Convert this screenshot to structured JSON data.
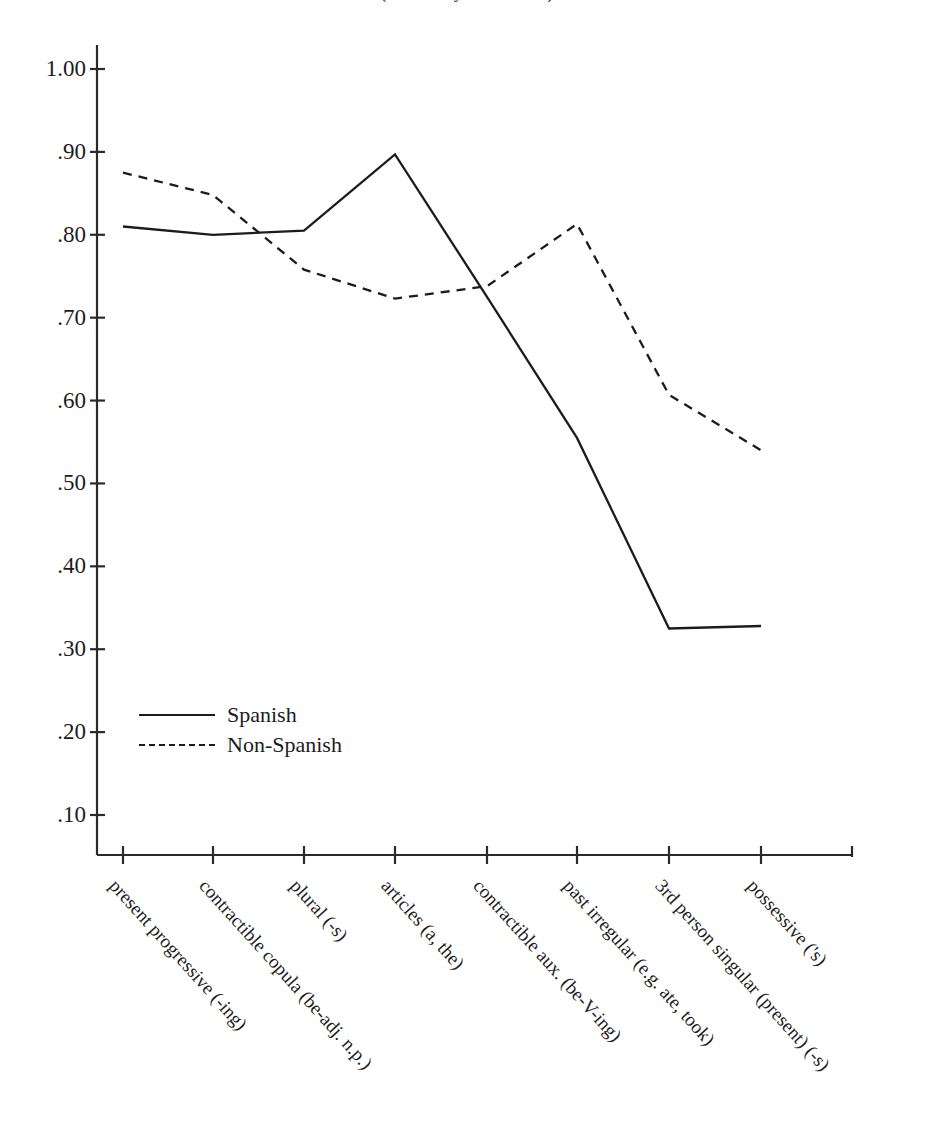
{
  "figure": {
    "title_clipped": "(from Dulay & Burt 1974)",
    "legend_position": "inside-lower-left"
  },
  "axes": {
    "y_tick_labels": [
      "1.00",
      ".90",
      ".80",
      ".70",
      ".60",
      ".50",
      ".40",
      ".30",
      ".20",
      ".10"
    ],
    "y_tick_values": [
      1.0,
      0.9,
      0.8,
      0.7,
      0.6,
      0.5,
      0.4,
      0.3,
      0.2,
      0.1
    ],
    "x_tick_labels": [
      "present progressive (-ing)",
      "contractible copula (be-adj. n.p.)",
      "plural (-s)",
      "articles (a, the)",
      "contractible aux. (be-V-ing)",
      "past irregular (e.g. ate, took)",
      "3rd person singular (present) (-s)",
      "possessive ('s)"
    ]
  },
  "legend": {
    "items": [
      {
        "label": "Spanish",
        "style": "solid"
      },
      {
        "label": "Non-Spanish",
        "style": "dashed"
      }
    ]
  },
  "colors": {
    "ink": "#1c1c1c",
    "axis": "#2a2a2a",
    "background": "#ffffff"
  },
  "chart_data": {
    "type": "line",
    "title": "(from Dulay & Burt 1974)",
    "xlabel": "",
    "ylabel": "",
    "ylim": [
      0.05,
      1.04
    ],
    "grid": false,
    "legend": "lower-left inside plot",
    "categories": [
      "present progressive (-ing)",
      "contractible copula (be-adj. n.p.)",
      "plural (-s)",
      "articles (a, the)",
      "contractible aux. (be-V-ing)",
      "past irregular (e.g. ate, took)",
      "3rd person singular (present) (-s)",
      "possessive ('s)"
    ],
    "series": [
      {
        "name": "Spanish",
        "style": "solid",
        "values": [
          0.81,
          0.8,
          0.805,
          0.897,
          0.725,
          0.555,
          0.325,
          0.328
        ]
      },
      {
        "name": "Non-Spanish",
        "style": "dashed",
        "values": [
          0.875,
          0.848,
          0.758,
          0.723,
          0.738,
          0.813,
          0.607,
          0.54
        ]
      }
    ]
  }
}
